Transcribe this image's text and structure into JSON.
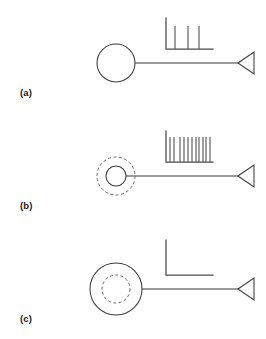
{
  "figure": {
    "background_color": "#ffffff",
    "line_color": "#3b3b3b",
    "axis_color": "#4a4a4a",
    "spike_color": "#5a5a5a",
    "dashed_color": "#6a6a6a",
    "width": 266,
    "height": 339
  },
  "panels": [
    {
      "id": "a",
      "label": "(a)",
      "soma": {
        "type": "solid-circle",
        "cx": 116,
        "cy": 63,
        "r": 19,
        "inner_dashed": false,
        "outer_dashed": false
      },
      "axon": {
        "x1": 135,
        "y1": 63,
        "x2": 238,
        "y2": 63
      },
      "terminal": {
        "type": "triangle-left",
        "tip_x": 238,
        "tip_y": 63,
        "base_x": 254,
        "half_height": 11
      },
      "raster": {
        "axis_x": 166,
        "axis_y_top": 18,
        "axis_y_base": 49,
        "axis_x_end": 213,
        "spike_count": 3,
        "spike_positions": [
          175,
          188,
          199
        ],
        "spike_height": 23,
        "description": "sparse regular firing"
      }
    },
    {
      "id": "b",
      "label": "(b)",
      "soma": {
        "type": "solid-circle-with-outer-dashed-ring",
        "cx": 116,
        "cy": 63,
        "r": 10,
        "inner_dashed": false,
        "outer_dashed": true,
        "outer_dashed_r": 19
      },
      "axon": {
        "x1": 126,
        "y1": 63,
        "x2": 238,
        "y2": 63
      },
      "terminal": {
        "type": "triangle-left",
        "tip_x": 238,
        "tip_y": 63,
        "base_x": 254,
        "half_height": 11
      },
      "raster": {
        "axis_x": 166,
        "axis_y_top": 18,
        "axis_y_base": 49,
        "axis_x_end": 213,
        "spike_count": 11,
        "spike_positions": [
          170,
          174,
          180,
          184,
          188,
          192,
          196,
          199,
          203,
          206,
          210
        ],
        "spike_height": 25,
        "description": "dense high-frequency firing"
      }
    },
    {
      "id": "c",
      "label": "(c)",
      "soma": {
        "type": "solid-circle-with-inner-dashed-ring",
        "cx": 116,
        "cy": 63,
        "r": 26,
        "inner_dashed": true,
        "inner_dashed_r": 14,
        "outer_dashed": false
      },
      "axon": {
        "x1": 142,
        "y1": 63,
        "x2": 238,
        "y2": 63
      },
      "terminal": {
        "type": "triangle-left",
        "tip_x": 238,
        "tip_y": 63,
        "base_x": 254,
        "half_height": 11
      },
      "raster": {
        "axis_x": 166,
        "axis_y_top": 14,
        "axis_y_base": 49,
        "axis_x_end": 213,
        "spike_count": 0,
        "spike_positions": [],
        "spike_height": 0,
        "description": "silent, no firing"
      }
    }
  ]
}
